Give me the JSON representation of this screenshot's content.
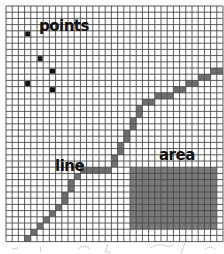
{
  "diagram": {
    "title": "",
    "grid": {
      "columns": 35,
      "rows": 38,
      "line_color": "#4a4a4a",
      "background": "#ffffff"
    },
    "labels": {
      "points": "points",
      "line": "line",
      "area": "area"
    },
    "points": {
      "color": "#111111",
      "cells": [
        [
          3,
          4
        ],
        [
          5,
          8
        ],
        [
          7,
          10
        ],
        [
          3,
          12
        ],
        [
          7,
          13
        ]
      ]
    },
    "line": {
      "color": "#6e6e6e",
      "cells": [
        [
          3,
          37
        ],
        [
          4,
          36
        ],
        [
          5,
          35
        ],
        [
          6,
          34
        ],
        [
          7,
          33
        ],
        [
          8,
          32
        ],
        [
          9,
          31
        ],
        [
          9,
          30
        ],
        [
          10,
          29
        ],
        [
          10,
          28
        ],
        [
          11,
          27
        ],
        [
          12,
          26
        ],
        [
          13,
          26
        ],
        [
          14,
          26
        ],
        [
          15,
          26
        ],
        [
          16,
          26
        ],
        [
          17,
          25
        ],
        [
          17,
          24
        ],
        [
          18,
          23
        ],
        [
          18,
          22
        ],
        [
          19,
          21
        ],
        [
          19,
          20
        ],
        [
          20,
          19
        ],
        [
          20,
          18
        ],
        [
          21,
          17
        ],
        [
          21,
          16
        ],
        [
          22,
          15
        ],
        [
          23,
          15
        ],
        [
          24,
          14
        ],
        [
          25,
          14
        ],
        [
          26,
          14
        ],
        [
          27,
          13
        ],
        [
          28,
          13
        ],
        [
          29,
          12
        ],
        [
          30,
          12
        ],
        [
          31,
          11
        ],
        [
          32,
          11
        ],
        [
          33,
          10
        ],
        [
          34,
          10
        ]
      ]
    },
    "area": {
      "color": "#7a7a7a",
      "col_range": [
        20,
        33
      ],
      "row_range": [
        26,
        35
      ]
    },
    "caption_marks_note": "illegible faint handwriting below grid"
  }
}
